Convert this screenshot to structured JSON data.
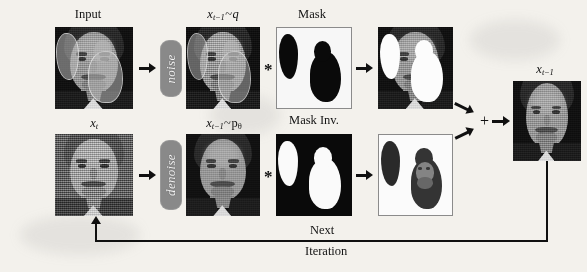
{
  "figure": {
    "background_color": "#f3f1ec",
    "ink_color": "#14120f",
    "process_box_color": "#8d8880"
  },
  "labels": {
    "input": "Input",
    "x_t": "x",
    "x_t_sub": "t",
    "x_prev": "x",
    "x_prev_sub": "t−1",
    "tilde": "~",
    "q": "q",
    "p": "p",
    "theta": "θ",
    "mask": "Mask",
    "mask_inv": "Mask Inv.",
    "next": "Next",
    "iteration": "Iteration"
  },
  "operations": {
    "noise": "noise",
    "denoise": "denoise",
    "multiply": "*",
    "plus": "+"
  },
  "panels": [
    {
      "id": "input",
      "caption": "Input",
      "kind": "portrait"
    },
    {
      "id": "x-t",
      "caption": "x_t",
      "kind": "portrait-noisy"
    },
    {
      "id": "x-prev-q",
      "caption": "x_{t-1}~q",
      "kind": "portrait-noisy2"
    },
    {
      "id": "x-prev-p",
      "caption": "x_{t-1}~p_theta",
      "kind": "portrait-soft"
    },
    {
      "id": "mask",
      "caption": "Mask",
      "kind": "mask"
    },
    {
      "id": "mask-inv",
      "caption": "Mask Inv.",
      "kind": "mask-inverted"
    },
    {
      "id": "masked-known",
      "caption": "",
      "kind": "portrait-masked"
    },
    {
      "id": "masked-gen",
      "caption": "",
      "kind": "portrait-masked-inv"
    },
    {
      "id": "output",
      "caption": "x_{t-1}",
      "kind": "portrait-result"
    }
  ]
}
